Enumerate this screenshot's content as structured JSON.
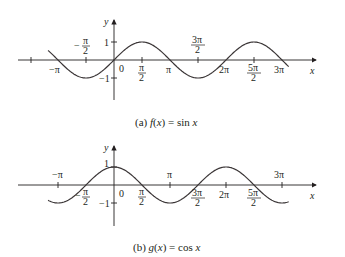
{
  "chart_data": [
    {
      "type": "line",
      "title": "(a) f(x) = sin x",
      "caption_prefix": "(a)",
      "function_label": "f(x) = sin x",
      "xlabel": "x",
      "ylabel": "y",
      "xlim": [
        -3.75,
        9.85
      ],
      "ylim": [
        -1.6,
        1.6
      ],
      "grid": false,
      "x_ticks": [
        "-3π/2",
        "-π",
        "-π/2",
        "0",
        "π/2",
        "π",
        "3π/2",
        "2π",
        "5π/2",
        "3π"
      ],
      "x_tick_labels_shown": [
        "-π/2 (above)",
        "-π",
        "π/2",
        "3π/2 (above)",
        "2π",
        "5π/2",
        "3π"
      ],
      "y_ticks": [
        1,
        -1
      ],
      "series": [
        {
          "name": "sin x",
          "x_range": [
            -3.7,
            9.8
          ],
          "points": [
            [
              -4.712,
              1
            ],
            [
              -3.1416,
              0
            ],
            [
              -1.5708,
              -1
            ],
            [
              0,
              0
            ],
            [
              1.5708,
              1
            ],
            [
              3.1416,
              0
            ],
            [
              4.712,
              -1
            ],
            [
              6.2832,
              0
            ],
            [
              7.854,
              1
            ],
            [
              9.4248,
              0
            ]
          ]
        }
      ]
    },
    {
      "type": "line",
      "title": "(b) g(x) = cos x",
      "caption_prefix": "(b)",
      "function_label": "g(x) = cos x",
      "xlabel": "x",
      "ylabel": "y",
      "xlim": [
        -3.75,
        9.85
      ],
      "ylim": [
        -1.6,
        1.6
      ],
      "grid": false,
      "x_ticks": [
        "-3π/2",
        "-π",
        "-π/2",
        "0",
        "π/2",
        "π",
        "3π/2",
        "2π",
        "5π/2",
        "3π"
      ],
      "y_ticks": [
        1,
        -1
      ],
      "series": [
        {
          "name": "cos x",
          "x_range": [
            -3.7,
            9.8
          ],
          "points": [
            [
              -3.1416,
              -1
            ],
            [
              -1.5708,
              0
            ],
            [
              0,
              1
            ],
            [
              1.5708,
              0
            ],
            [
              3.1416,
              -1
            ],
            [
              4.712,
              0
            ],
            [
              6.2832,
              1
            ],
            [
              7.854,
              0
            ],
            [
              9.4248,
              -1
            ]
          ]
        }
      ]
    }
  ],
  "labels": {
    "y": "y",
    "x": "x",
    "one": "1",
    "neg_one": "−1",
    "zero": "0",
    "pi": "π",
    "neg_pi": "−π",
    "two_pi": "2π",
    "three_pi": "3π",
    "minus": "−",
    "half_num_pi": "π",
    "three_pi_num": "3π",
    "five_pi_num": "5π",
    "den_2": "2"
  },
  "captions": {
    "a_prefix": "(a) ",
    "a_fn": "f",
    "a_arg": "(x)",
    "a_eq": " = sin ",
    "a_var": "x",
    "b_prefix": "(b) ",
    "b_fn": "g",
    "b_arg": "(x)",
    "b_eq": " = cos ",
    "b_var": "x"
  }
}
